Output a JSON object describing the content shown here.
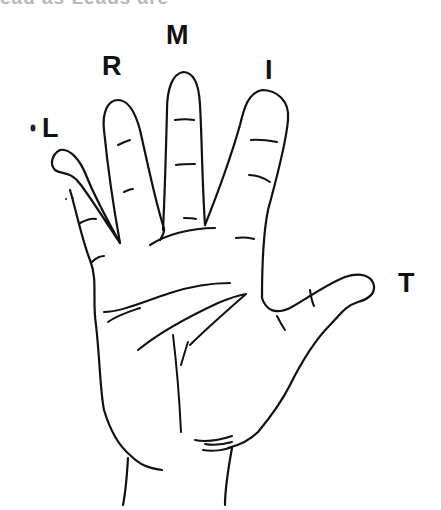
{
  "figure": {
    "cut_off_title": "ead as Leads are"
  },
  "labels": {
    "little": "L",
    "ring": "R",
    "middle": "M",
    "index": "I",
    "thumb": "T"
  },
  "colors": {
    "line": "#111111",
    "background": "#ffffff"
  }
}
